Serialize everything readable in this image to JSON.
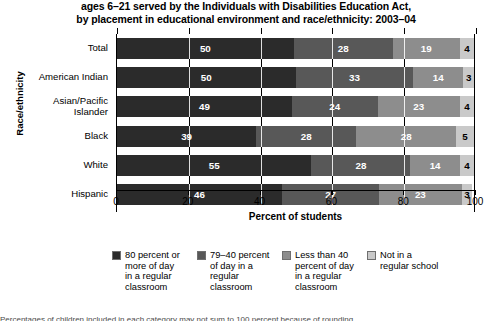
{
  "title": {
    "line1": "ages 6–21 served by the Individuals with Disabilities Education Act,",
    "line2": "by placement in educational environment and race/ethnicity: 2003–04"
  },
  "axes": {
    "y_title": "Race/ethnicity",
    "x_title": "Percent of students",
    "x_ticks": [
      "0",
      "20",
      "40",
      "60",
      "80",
      "100"
    ]
  },
  "legend": {
    "items": [
      {
        "label": "80 percent or\nmore of day\nin a regular\nclassroom",
        "color": "#2b2b2b"
      },
      {
        "label": "79–40 percent\nof day in a\nregular\nclassroom",
        "color": "#585858"
      },
      {
        "label": "Less than 40\npercent of day\nin a regular\nclassroom",
        "color": "#8d8d8d"
      },
      {
        "label": "Not in a\nregular school",
        "color": "#c9c9c9"
      }
    ]
  },
  "footnote": {
    "clipped_line": "Percentages of children included in each category may not sum to 100 percent because of rounding."
  },
  "chart_data": {
    "type": "bar",
    "orientation": "horizontal",
    "stacked": true,
    "title": "ages 6–21 served by the Individuals with Disabilities Education Act, by placement in educational environment and race/ethnicity: 2003–04",
    "xlabel": "Percent of students",
    "ylabel": "Race/ethnicity",
    "xlim": [
      0,
      100
    ],
    "xticks": [
      0,
      20,
      40,
      60,
      80,
      100
    ],
    "grid": true,
    "legend_position": "bottom",
    "categories": [
      "Total",
      "American Indian",
      "Asian/Pacific Islander",
      "Black",
      "White",
      "Hispanic"
    ],
    "series": [
      {
        "name": "80 percent or more of day in a regular classroom",
        "color": "#2b2b2b",
        "values": [
          50,
          50,
          49,
          39,
          55,
          46
        ]
      },
      {
        "name": "79–40 percent of day in a regular classroom",
        "color": "#585858",
        "values": [
          28,
          33,
          24,
          28,
          28,
          27
        ]
      },
      {
        "name": "Less than 40 percent of day in a regular classroom",
        "color": "#8d8d8d",
        "values": [
          19,
          14,
          23,
          28,
          14,
          23
        ]
      },
      {
        "name": "Not in a regular school",
        "color": "#c9c9c9",
        "values": [
          4,
          3,
          4,
          5,
          4,
          3
        ]
      }
    ]
  }
}
